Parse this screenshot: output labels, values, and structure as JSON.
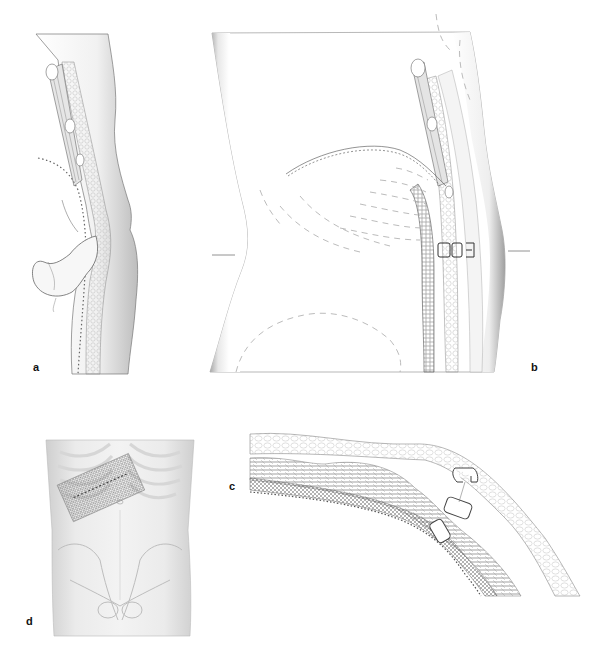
{
  "figure": {
    "panels": [
      {
        "id": "a",
        "label": "a",
        "description": "Sagittal section of abdominal wall with herniated bowel loop protruding through the wall layers"
      },
      {
        "id": "b",
        "label": "b",
        "description": "Lateral torso view with mesh placed in preperitoneal layer, clips fixing mesh, dashed outlines of underlying organs, level markers"
      },
      {
        "id": "c",
        "label": "c",
        "description": "Cross-section close-up of abdominal wall layers showing mesh fixed with clips/staples"
      },
      {
        "id": "d",
        "label": "d",
        "description": "Frontal view of torso showing rectangular mesh placed over the left upper abdomen below the rib cage"
      }
    ]
  },
  "colors": {
    "background": "#ffffff",
    "line": "#555555",
    "shade": "#9a9a9a",
    "label": "#111111"
  }
}
